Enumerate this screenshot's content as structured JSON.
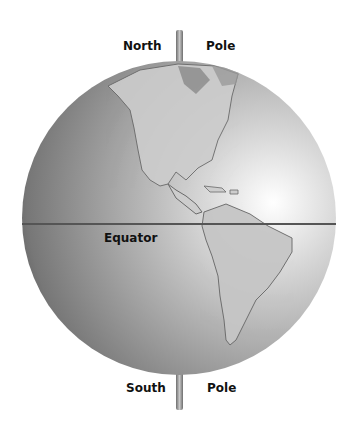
{
  "diagram": {
    "labels": {
      "north_left": "North",
      "north_right": "Pole",
      "south_left": "South",
      "south_right": "Pole",
      "equator": "Equator"
    },
    "colors": {
      "background": "#ffffff",
      "globe_light": "#f4f4f4",
      "globe_mid": "#a8a8a8",
      "globe_dark": "#5e5e5e",
      "land": "#c9c9c9",
      "land_outline": "#6a6a6a",
      "equator_line": "#555555",
      "axis": "#8a8a8a",
      "text": "#111111"
    }
  }
}
